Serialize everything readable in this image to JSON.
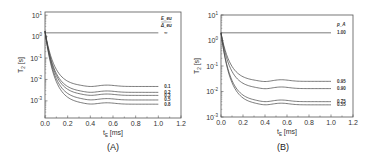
{
  "chart_data": [
    {
      "panel": "A",
      "type": "line",
      "panel_label": "(A)",
      "xlabel": "t_E [ms]",
      "xlabel_main": "t",
      "xlabel_sub": "E",
      "xlabel_unit": " [ms]",
      "ylabel": "T_2 [s]",
      "ylabel_main": "T",
      "ylabel_sub": "2",
      "ylabel_unit": " [s]",
      "xlim": [
        0.0,
        1.2
      ],
      "ylim_log10": [
        -3.9,
        1
      ],
      "yscale": "log",
      "xticks": [
        "0.0",
        "0.2",
        "0.4",
        "0.6",
        "0.8",
        "1.0",
        "1.2"
      ],
      "yticks": [
        {
          "base": "10",
          "exp": "1",
          "value": 1
        },
        {
          "base": "10",
          "exp": "0",
          "value": 0
        },
        {
          "base": "10",
          "exp": "-1",
          "value": -1
        },
        {
          "base": "10",
          "exp": "-2",
          "value": -2
        },
        {
          "base": "10",
          "exp": "-3",
          "value": -3
        }
      ],
      "legend_title": "E_eu / Δ_eu",
      "legend_title_top": "E_eu",
      "legend_title_bottom": "Δ_eu",
      "series": [
        {
          "name": "∞",
          "label": "∞",
          "plateau": 1.5,
          "flat": true
        },
        {
          "name": "0.1",
          "label": "0.1",
          "plateau": 0.0047
        },
        {
          "name": "0.2",
          "label": "0.2",
          "plateau": 0.0025
        },
        {
          "name": "0.3",
          "label": "0.3",
          "plateau": 0.0018
        },
        {
          "name": "0.5",
          "label": "0.5",
          "plateau": 0.0011
        },
        {
          "name": "0.8",
          "label": "0.8",
          "plateau": 0.0007
        }
      ],
      "start": {
        "x": 0.0,
        "y": 1.8
      },
      "x_end": 1.0,
      "grid": false
    },
    {
      "panel": "B",
      "type": "line",
      "panel_label": "(B)",
      "xlabel": "t_E [ms]",
      "xlabel_main": "t",
      "xlabel_sub": "E",
      "xlabel_unit": " [ms]",
      "ylabel": "T_2 [s]",
      "ylabel_main": "T",
      "ylabel_sub": "2",
      "ylabel_unit": " [s]",
      "xlim": [
        0.0,
        1.2
      ],
      "ylim_log10": [
        -3,
        1
      ],
      "yscale": "log",
      "xticks": [
        "0.0",
        "0.2",
        "0.4",
        "0.6",
        "0.8",
        "1.0",
        "1.2"
      ],
      "yticks": [
        {
          "base": "10",
          "exp": "1",
          "value": 1
        },
        {
          "base": "10",
          "exp": "0",
          "value": 0
        },
        {
          "base": "10",
          "exp": "-1",
          "value": -1
        },
        {
          "base": "10",
          "exp": "-2",
          "value": -2
        },
        {
          "base": "10",
          "exp": "-3",
          "value": -3
        }
      ],
      "legend_title": "p_A",
      "series": [
        {
          "name": "1.00",
          "label": "1.00",
          "plateau": 2.0,
          "flat": true
        },
        {
          "name": "0.95",
          "label": "0.95",
          "plateau": 0.025
        },
        {
          "name": "0.90",
          "label": "0.90",
          "plateau": 0.013
        },
        {
          "name": "0.75",
          "label": "0.75",
          "plateau": 0.004
        },
        {
          "name": "0.55",
          "label": "0.55",
          "plateau": 0.003
        }
      ],
      "start": {
        "x": 0.0,
        "y": 2.0
      },
      "x_end": 1.0,
      "grid": false
    }
  ],
  "layout": {
    "panels": [
      {
        "left": 45,
        "top": 12,
        "right": 181,
        "bottom": 118,
        "ytop_log": 1.15,
        "ybot_log": -3.8
      },
      {
        "left": 221,
        "top": 15,
        "right": 353,
        "bottom": 117,
        "ytop_log": 1.0,
        "ybot_log": -3.0
      }
    ]
  }
}
